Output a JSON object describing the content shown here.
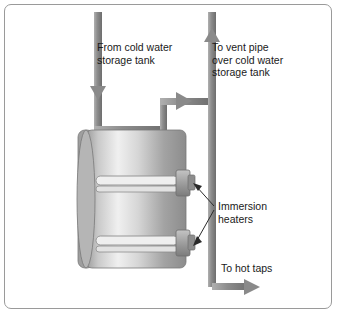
{
  "diagram": {
    "labels": {
      "cold_feed": "From cold water\nstorage tank",
      "vent_pipe": "To vent pipe\nover cold water\nstorage tank",
      "immersion_heaters": "Immersion\nheaters",
      "hot_taps": "To hot taps"
    },
    "colors": {
      "pipe": "#8a8a8a",
      "pipe_dark": "#6f6f6f",
      "cylinder_light": "#f2f2f2",
      "cylinder_mid": "#b9b9b9",
      "cylinder_dark": "#7d7d7d",
      "border": "#9a9a9a",
      "text": "#1a1a1a",
      "heater_body": "#9b9b9b",
      "heater_element": "#e8e8e8"
    },
    "parts": [
      {
        "name": "cold-feed-pipe",
        "orientation": "vertical",
        "x": 98
      },
      {
        "name": "vent-pipe",
        "orientation": "vertical",
        "x": 212
      },
      {
        "name": "hot-water-cylinder",
        "shape": "rounded-rectangle"
      },
      {
        "name": "upper-immersion-heater",
        "y": 180
      },
      {
        "name": "lower-immersion-heater",
        "y": 240
      },
      {
        "name": "hot-taps-outlet-arrow",
        "direction": "right"
      }
    ]
  }
}
